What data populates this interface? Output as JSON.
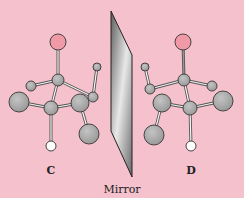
{
  "figure": {
    "labels": {
      "left_molecule": "C",
      "right_molecule": "D",
      "mirror": "Mirror"
    },
    "colors": {
      "background": "#f5c1cc",
      "carbon": "#a9a9a9",
      "oxygen": "#ef9aa6",
      "hydrogen": "#ffffff",
      "mirror_light": "#e6e6e6",
      "mirror_dark": "#6f6f6f"
    }
  }
}
